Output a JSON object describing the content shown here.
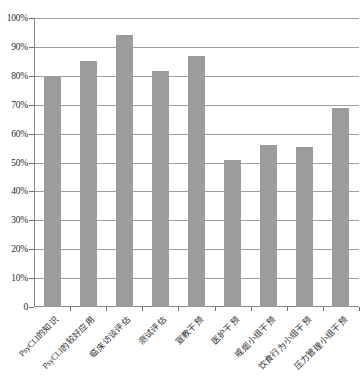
{
  "chart_data": {
    "type": "bar",
    "title": "",
    "subtitle": "",
    "xlabel": "",
    "ylabel": "",
    "ylim": [
      0,
      100
    ],
    "grid": true,
    "legend": false,
    "bar_color": "#9c9c9c",
    "axis_color": "#8a8a8a",
    "gridline_color": "#9f9f9f",
    "ytick_labels": [
      "100%",
      "90%",
      "80%",
      "70%",
      "60%",
      "50%",
      "40%",
      "30%",
      "20%",
      "10%",
      "0"
    ],
    "ytick_values": [
      100,
      90,
      80,
      70,
      60,
      50,
      40,
      30,
      20,
      10,
      0
    ],
    "categories": [
      "PsyCLI的知识",
      "PsyCLI的较好应用",
      "临床访谈评估",
      "测试评估",
      "宣教干预",
      "医护干预",
      "戒烟小组干预",
      "饮食行为小组干预",
      "压力管理小组干预"
    ],
    "values": [
      80,
      85,
      94,
      81.5,
      87,
      51,
      56,
      55.5,
      69
    ]
  }
}
